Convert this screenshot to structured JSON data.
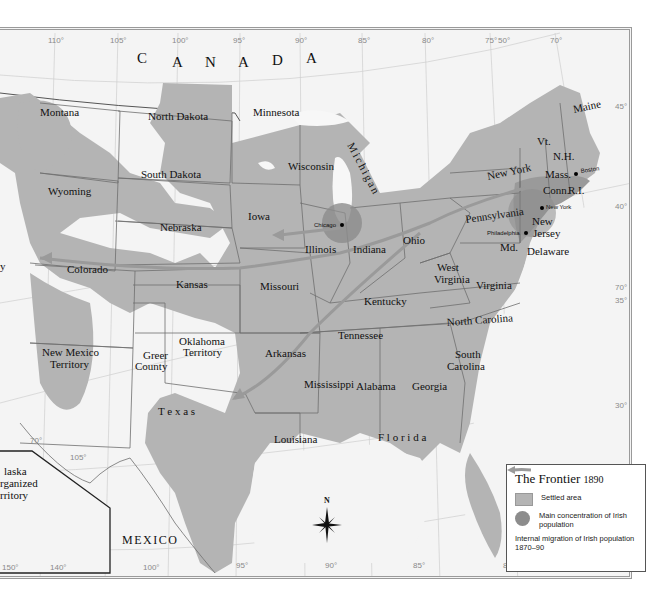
{
  "map": {
    "title": "The Frontier",
    "year": "1890",
    "country_labels": {
      "canada": [
        "C",
        "A",
        "N",
        "A",
        "D",
        "A"
      ],
      "mexico": "MEXICO"
    },
    "longitude_ticks_top": [
      "110°",
      "105°",
      "100°",
      "95°",
      "90°",
      "85°",
      "80°",
      "75°",
      "50°",
      "70°"
    ],
    "longitude_ticks_bottom": [
      "150°",
      "140°",
      "100°",
      "95°",
      "90°",
      "85°",
      "80°",
      "75°"
    ],
    "latitude_ticks_right": [
      "45°",
      "40°",
      "70°",
      "35°",
      "30°",
      "25°"
    ],
    "inset_ticks": [
      "70°",
      "105°"
    ],
    "states": {
      "montana": "Montana",
      "north_dakota": "North Dakota",
      "minnesota": "Minnesota",
      "wisconsin": "Wisconsin",
      "michigan": "Michigan",
      "south_dakota": "South Dakota",
      "wyoming": "Wyoming",
      "iowa": "Iowa",
      "nebraska": "Nebraska",
      "illinois": "Illinois",
      "indiana": "Indiana",
      "ohio": "Ohio",
      "colorado": "Colorado",
      "kansas": "Kansas",
      "missouri": "Missouri",
      "kentucky": "Kentucky",
      "west_virginia_1": "West",
      "west_virginia_2": "Virginia",
      "virginia": "Virginia",
      "new_mexico_1": "New Mexico",
      "new_mexico_2": "Territory",
      "oklahoma_1": "Oklahoma",
      "oklahoma_2": "Territory",
      "greer_1": "Greer",
      "greer_2": "County",
      "arkansas": "Arkansas",
      "tennessee": "Tennessee",
      "north_carolina": "North Carolina",
      "south_carolina_1": "South",
      "south_carolina_2": "Carolina",
      "mississippi": "Mississippi",
      "alabama": "Alabama",
      "georgia": "Georgia",
      "texas": "T e x a s",
      "louisiana": "Louisiana",
      "florida": "F l o r i d a",
      "new_york": "New York",
      "pennsylvania": "Pennsylvania",
      "new_jersey_1": "New",
      "new_jersey_2": "Jersey",
      "maryland": "Md.",
      "delaware": "Delaware",
      "vermont": "Vt.",
      "new_hampshire": "N.H.",
      "maine": "Maine",
      "massachusetts": "Mass.",
      "connecticut": "Conn.",
      "rhode_island": "R.I.",
      "partial_left": "y",
      "alaska_1": "laska",
      "alaska_2": "rganized",
      "alaska_3": "rritory"
    },
    "cities": {
      "chicago": "Chicago",
      "boston": "Boston",
      "new_york": "New York",
      "philadelphia": "Philadelphia"
    },
    "compass": {
      "label": "N"
    },
    "colors": {
      "settled": "#b4b4b4",
      "irish_concentration": "#8c8c8c",
      "migration_arrow": "#9a9a9a",
      "background": "#f4f4f4"
    }
  },
  "legend": {
    "title": "The Frontier",
    "year": "1890",
    "items": [
      {
        "symbol": "settled-area-swatch",
        "label": "Settled area"
      },
      {
        "symbol": "irish-concentration-dot",
        "label": "Main concentration of Irish population"
      },
      {
        "symbol": "migration-arrow",
        "label": "Internal migration of Irish population 1870–90"
      }
    ]
  }
}
